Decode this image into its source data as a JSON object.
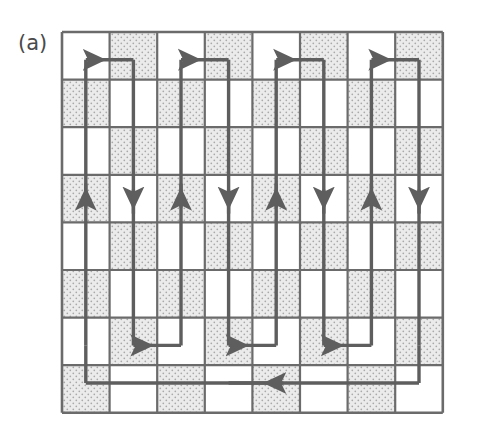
{
  "figure": {
    "panel_label": "(a)",
    "caption_text": "",
    "type": "coverage-path-diagram"
  },
  "grid": {
    "rows": 8,
    "cols": 8,
    "origin_x": 62,
    "origin_y": 32,
    "cell_size": 47.6,
    "border_color": "#6b6b6b",
    "border_width": 2.2,
    "outer_border_width": 2.6,
    "cell_white": "#ffffff",
    "cell_shaded": "#e8e8e8",
    "stipple_dot_color": "#a8a8a8",
    "pattern": "checkerboard",
    "shaded_parity": 1,
    "shaded_cells": [
      [
        0,
        1
      ],
      [
        0,
        3
      ],
      [
        0,
        5
      ],
      [
        0,
        7
      ],
      [
        1,
        0
      ],
      [
        1,
        2
      ],
      [
        1,
        4
      ],
      [
        1,
        6
      ],
      [
        2,
        1
      ],
      [
        2,
        3
      ],
      [
        2,
        5
      ],
      [
        2,
        7
      ],
      [
        3,
        0
      ],
      [
        3,
        2
      ],
      [
        3,
        4
      ],
      [
        3,
        6
      ],
      [
        4,
        1
      ],
      [
        4,
        3
      ],
      [
        4,
        5
      ],
      [
        4,
        7
      ],
      [
        5,
        0
      ],
      [
        5,
        2
      ],
      [
        5,
        4
      ],
      [
        5,
        6
      ],
      [
        6,
        1
      ],
      [
        6,
        3
      ],
      [
        6,
        5
      ],
      [
        6,
        7
      ],
      [
        7,
        0
      ],
      [
        7,
        2
      ],
      [
        7,
        4
      ],
      [
        7,
        6
      ]
    ]
  },
  "path": {
    "color": "#5e5e5e",
    "width": 3.4,
    "arrow_color": "#5e5e5e",
    "arrow_count": 15,
    "description": "Serpentine sweep: descends column 1, ascends column 2, turns at top, repeats for 4 column pairs, returns along bottom row",
    "vertical_arrows": {
      "row_index": 3,
      "directions": [
        "down",
        "up",
        "down",
        "up",
        "down",
        "up",
        "down",
        "up"
      ],
      "count": 8
    },
    "top_arrows": {
      "row_index": 0,
      "direction": "left",
      "count": 4
    },
    "bottom_arrows": {
      "row_index": 6,
      "direction": "left",
      "count": 3
    },
    "return_arrow": {
      "row_index": 7,
      "direction": "right",
      "count": 1
    }
  }
}
